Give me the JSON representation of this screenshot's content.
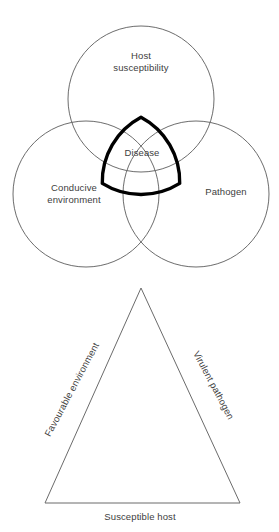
{
  "figure": {
    "background_color": "#ffffff",
    "line_color": "#5b5b5b",
    "emphasis_color": "#000000",
    "text_color": "#404040"
  },
  "venn": {
    "name": "disease-triangle-venn",
    "circles": [
      {
        "id": "host",
        "label": "Host\nsusceptibility",
        "cx": 141,
        "cy": 99,
        "r": 73
      },
      {
        "id": "environment",
        "label": "Conducive\nenvironment",
        "cx": 86,
        "cy": 194,
        "r": 73
      },
      {
        "id": "pathogen",
        "label": "Pathogen",
        "cx": 196,
        "cy": 194,
        "r": 73
      }
    ],
    "intersection": {
      "id": "disease",
      "label": "Disease",
      "emphasized": true,
      "stroke_color": "#000000"
    }
  },
  "triangle": {
    "name": "disease-triangle",
    "center_label": "Disease",
    "vertices": {
      "apex": [
        141,
        10
      ],
      "left": [
        45,
        225
      ],
      "right": [
        240,
        225
      ]
    },
    "sides": [
      {
        "id": "left-side",
        "label": "Favourable environment",
        "rotation_deg": -62
      },
      {
        "id": "right-side",
        "label": "Virulent pathogen",
        "rotation_deg": 62
      },
      {
        "id": "base",
        "label": "Susceptible host",
        "rotation_deg": 0
      }
    ]
  }
}
